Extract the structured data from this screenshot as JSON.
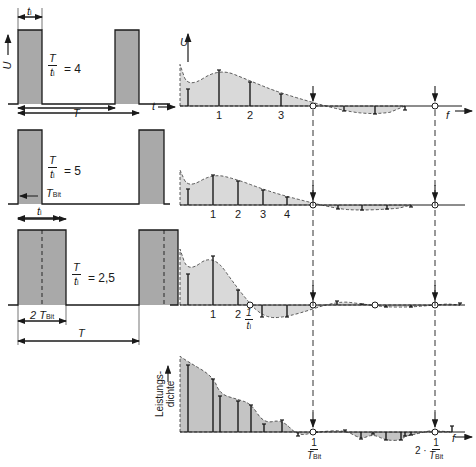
{
  "colors": {
    "ink": "#1a1a1a",
    "pulse_fill": "#a9a9a9",
    "spectrum_fill": "#d9d9d9",
    "power_fill": "#c4c4c4"
  },
  "time_panels": [
    {
      "ratio_label": "4",
      "ti_label": "t",
      "ti_sub": "i",
      "period_label": "T",
      "axis_u": "U",
      "axis_t": "t",
      "baseline_y": 104,
      "top_y": 30,
      "pulses": [
        [
          18,
          42
        ],
        [
          115,
          139
        ]
      ]
    },
    {
      "ratio_label": "5",
      "tbit_label": "T",
      "tbit_sub": "Bit",
      "ti_label": "t",
      "ti_sub": "i",
      "baseline_y": 204,
      "top_y": 130,
      "pulses": [
        [
          18,
          42
        ],
        [
          139,
          164
        ]
      ]
    },
    {
      "ratio_label": "2,5",
      "two_tbit_label": "2 T",
      "tbit_sub": "Bit",
      "period_label": "T",
      "baseline_y": 305,
      "top_y": 230,
      "pulses": [
        [
          18,
          66
        ],
        [
          139,
          178
        ]
      ]
    }
  ],
  "spectra": [
    {
      "axis_u": "U",
      "axis_f": "f",
      "tick_labels": [
        "1",
        "2",
        "3"
      ],
      "baseline_y": 106,
      "lines_x": [
        188,
        219,
        250,
        281,
        344,
        375,
        405
      ],
      "lines_h": [
        17,
        36,
        24,
        12,
        -5,
        -8,
        -4
      ]
    },
    {
      "tick_labels": [
        "1",
        "2",
        "3",
        "4"
      ],
      "baseline_y": 205,
      "lines_x": [
        188,
        213,
        238,
        263,
        287,
        338,
        362,
        387,
        411
      ],
      "lines_h": [
        16,
        30,
        24,
        15,
        8,
        -4,
        -5,
        -4,
        -2
      ]
    },
    {
      "tick_labels": [
        "1",
        "2"
      ],
      "freq_label_num": "1",
      "freq_label_den": "t",
      "freq_label_den_sub": "i",
      "baseline_y": 305,
      "lines_x": [
        188,
        213,
        238,
        262,
        287,
        337,
        362,
        386,
        411,
        435,
        460
      ],
      "lines_h": [
        31,
        49,
        15,
        -12,
        -12,
        4,
        1,
        -2,
        -2,
        0,
        2
      ]
    },
    {
      "ylabel_line1": "Leistungs-",
      "ylabel_line2": "dichte",
      "axis_f": "f",
      "marker1_num": "1",
      "marker1_den": "T",
      "marker1_sub": "Bit",
      "marker2_prefix": "2 ·",
      "marker2_num": "1",
      "marker2_den": "T",
      "marker2_sub": "Bit",
      "baseline_y": 432,
      "lines_x": [
        188,
        213,
        220,
        238,
        251,
        264,
        282,
        298,
        316,
        345,
        361,
        373,
        386,
        401,
        405,
        411,
        452
      ],
      "lines_h": [
        67,
        53,
        36,
        31,
        27,
        8,
        12,
        -4,
        0,
        2,
        -7,
        -2,
        -8,
        -8,
        -4,
        -3,
        6
      ]
    }
  ],
  "markers": {
    "x1": 313,
    "x2": 435
  }
}
